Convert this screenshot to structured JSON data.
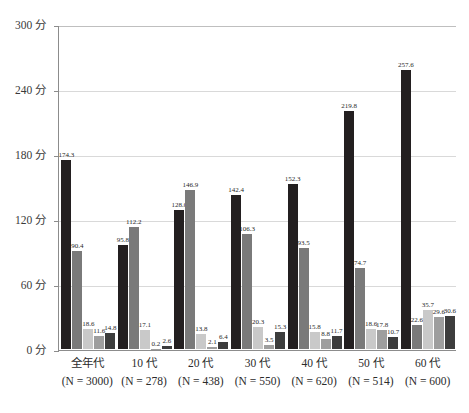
{
  "chart_data": {
    "type": "bar",
    "title": "",
    "subtitle": "",
    "xlabel": "",
    "ylabel": "",
    "ylim": [
      0,
      300
    ],
    "y_ticks": [
      0,
      60,
      120,
      180,
      240,
      300
    ],
    "y_tick_labels": [
      "0 分",
      "60 分",
      "120 分",
      "180 分",
      "240 分",
      "300 分"
    ],
    "grid": true,
    "legend": "none",
    "unit_suffix": "分",
    "categories": [
      "全年代",
      "10 代",
      "20 代",
      "30 代",
      "40 代",
      "50 代",
      "60 代"
    ],
    "category_sublabels": [
      "(N = 3000)",
      "(N = 278)",
      "(N = 438)",
      "(N = 550)",
      "(N = 620)",
      "(N = 514)",
      "(N = 600)"
    ],
    "series": [
      {
        "name": "series-1",
        "color": "#231f20",
        "values": [
          174.3,
          95.8,
          128.0,
          142.4,
          152.3,
          219.8,
          257.6
        ]
      },
      {
        "name": "series-2",
        "color": "#7a7a7a",
        "values": [
          90.4,
          112.2,
          146.9,
          106.3,
          93.5,
          74.7,
          22.6
        ]
      },
      {
        "name": "series-3",
        "color": "#c9c9c9",
        "values": [
          18.6,
          17.1,
          13.8,
          20.3,
          15.8,
          18.6,
          35.7
        ]
      },
      {
        "name": "series-4",
        "color": "#9e9e9e",
        "values": [
          11.6,
          0.2,
          2.1,
          3.5,
          8.8,
          17.8,
          29.6
        ]
      },
      {
        "name": "series-5",
        "color": "#3d3d3d",
        "values": [
          14.8,
          2.6,
          6.4,
          15.3,
          11.7,
          10.7,
          30.6
        ]
      }
    ]
  }
}
